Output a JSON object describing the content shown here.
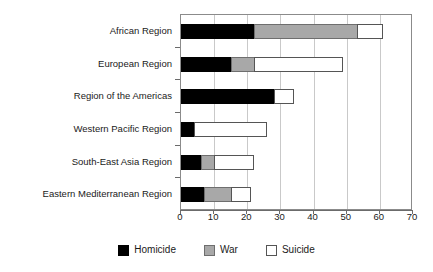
{
  "chart_data": {
    "type": "bar",
    "orientation": "horizontal",
    "stacked": true,
    "title": "",
    "xlabel": "",
    "ylabel": "",
    "xlim": [
      0,
      70
    ],
    "xticks": [
      0,
      10,
      20,
      30,
      40,
      50,
      60,
      70
    ],
    "grid": "vertical",
    "legend_position": "bottom",
    "categories": [
      "African Region",
      "European Region",
      "Region of the Americas",
      "Western Pacific Region",
      "South-East Asia Region",
      "Eastern Mediterranean Region"
    ],
    "series": [
      {
        "name": "Homicide",
        "color": "#000000",
        "values": [
          22,
          15,
          28,
          4,
          6,
          7
        ]
      },
      {
        "name": "War",
        "color": "#a8a8a8",
        "values": [
          31,
          7,
          0,
          0,
          4,
          8
        ]
      },
      {
        "name": "Suicide",
        "color": "#ffffff",
        "values": [
          8,
          27,
          6,
          22,
          12,
          6
        ]
      }
    ],
    "totals": [
      61,
      49,
      34,
      26,
      22,
      21
    ]
  },
  "legend": {
    "items": [
      {
        "label": "Homicide",
        "swatch": "homicide"
      },
      {
        "label": "War",
        "swatch": "war"
      },
      {
        "label": "Suicide",
        "swatch": "suicide"
      }
    ]
  },
  "axis": {
    "tick_labels": [
      "0",
      "10",
      "20",
      "30",
      "40",
      "50",
      "60",
      "70"
    ]
  }
}
